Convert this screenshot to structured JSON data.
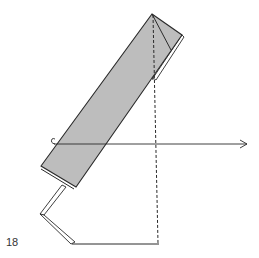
{
  "step": {
    "number": "18"
  },
  "colors": {
    "paper_fill": "#bdbdbd",
    "line": "#2a2a2a",
    "background": "#ffffff"
  },
  "diagram": {
    "type": "origami-fold-instruction",
    "elements": [
      "shaded-folded-strip",
      "top-corner-fold-line",
      "vertical-valley-fold-dashed-line",
      "horizontal-rotate-arrow",
      "lower-white-strip-legs",
      "baseline"
    ]
  }
}
